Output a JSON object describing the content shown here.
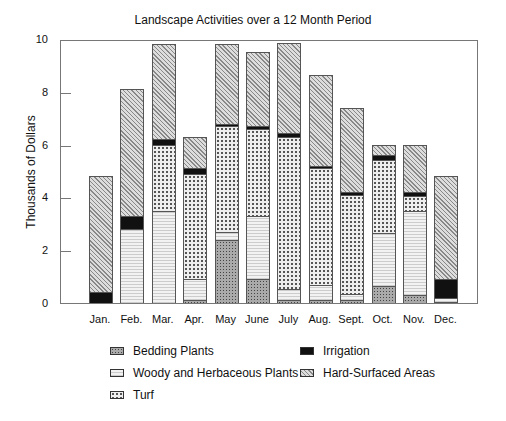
{
  "chart_data": {
    "type": "bar",
    "stacked": true,
    "title": "Landscape Activities over a 12 Month Period",
    "xlabel": "",
    "ylabel": "Thousands of Dollars",
    "ylim": [
      0,
      10
    ],
    "yticks": [
      "0",
      "2",
      "4",
      "6",
      "8",
      "10"
    ],
    "grid": false,
    "legend_position": "bottom",
    "categories": [
      "Jan.",
      "Feb.",
      "Mar.",
      "Apr.",
      "May",
      "June",
      "July",
      "Aug.",
      "Sept.",
      "Oct.",
      "Nov.",
      "Dec."
    ],
    "series": [
      {
        "name": "Bedding Plants",
        "key": "bedding",
        "values": [
          0,
          0,
          0,
          0.1,
          2.4,
          0.9,
          0.1,
          0.1,
          0.1,
          0.65,
          0.3,
          0.05
        ]
      },
      {
        "name": "Woody and Herbaceous Plants",
        "key": "woody",
        "values": [
          0,
          2.8,
          3.5,
          0.8,
          0.3,
          2.4,
          0.45,
          0.6,
          0.25,
          2.0,
          3.2,
          0.15
        ]
      },
      {
        "name": "Turf",
        "key": "turf",
        "values": [
          0,
          0,
          2.5,
          4.0,
          4.0,
          3.3,
          5.75,
          4.4,
          3.75,
          2.75,
          0.55,
          0
        ]
      },
      {
        "name": "Irrigation",
        "key": "irrigation",
        "values": [
          0.4,
          0.5,
          0.2,
          0.2,
          0.1,
          0.1,
          0.15,
          0.1,
          0.1,
          0.2,
          0.15,
          0.7
        ]
      },
      {
        "name": "Hard-Surfaced Areas",
        "key": "hard",
        "values": [
          4.4,
          4.8,
          3.6,
          1.2,
          3.0,
          2.8,
          3.4,
          3.45,
          3.2,
          0.4,
          1.8,
          3.9
        ]
      }
    ]
  },
  "legend": [
    {
      "label": "Bedding Plants",
      "key": "bedding"
    },
    {
      "label": "Irrigation",
      "key": "irrigation"
    },
    {
      "label": "Woody and Herbaceous Plants",
      "key": "woody"
    },
    {
      "label": "Hard-Surfaced Areas",
      "key": "hard"
    },
    {
      "label": "Turf",
      "key": "turf"
    }
  ]
}
